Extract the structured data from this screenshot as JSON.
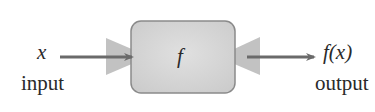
{
  "diagram": {
    "type": "function-machine",
    "input": {
      "symbol": "x",
      "caption": "input"
    },
    "machine": {
      "label": "f"
    },
    "output": {
      "symbol": "f(x)",
      "caption": "output"
    }
  },
  "colors": {
    "box_fill": "#d4d4d4",
    "box_stroke": "#8a8a8a",
    "funnel_fill": "#c2c2c2",
    "arrow": "#6a6a6a",
    "text": "#2a2a2a"
  }
}
